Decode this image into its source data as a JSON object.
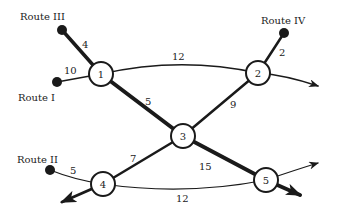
{
  "diagram": {
    "type": "network",
    "colors": {
      "line": "#1a1a1a",
      "node_fill": "#ffffff",
      "terminal": "#1a1a1a"
    },
    "nodes": [
      {
        "id": "1",
        "label": "1"
      },
      {
        "id": "2",
        "label": "2"
      },
      {
        "id": "3",
        "label": "3"
      },
      {
        "id": "4",
        "label": "4"
      },
      {
        "id": "5",
        "label": "5"
      }
    ],
    "routes": [
      {
        "name": "Route I",
        "connects_to": "1",
        "weight": "10"
      },
      {
        "name": "Route II",
        "connects_to": "4",
        "weight": "5"
      },
      {
        "name": "Route III",
        "connects_to": "1",
        "weight": "4"
      },
      {
        "name": "Route IV",
        "connects_to": "2",
        "weight": "2"
      }
    ],
    "edges": [
      {
        "from": "1",
        "to": "2",
        "weight": "12",
        "style": "thin-curve"
      },
      {
        "from": "1",
        "to": "3",
        "weight": "5",
        "style": "thick"
      },
      {
        "from": "2",
        "to": "3",
        "weight": "9",
        "style": "medium"
      },
      {
        "from": "3",
        "to": "4",
        "weight": "7",
        "style": "medium"
      },
      {
        "from": "3",
        "to": "5",
        "weight": "15",
        "style": "thick"
      },
      {
        "from": "4",
        "to": "5",
        "weight": "12",
        "style": "thin-curve"
      }
    ],
    "exits": [
      {
        "from": "2",
        "style": "thin-arrow"
      },
      {
        "from": "4",
        "style": "thick-arrow"
      },
      {
        "from": "5",
        "style": "thin-arrow"
      },
      {
        "from": "5",
        "style": "thick-arrow"
      }
    ]
  }
}
